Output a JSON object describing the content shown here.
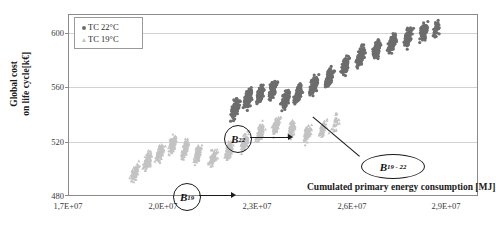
{
  "chart_data": {
    "type": "scatter",
    "title": "",
    "xlabel": "Cumulated primary energy consumption [MJ]",
    "ylabel": "Global cost\non life cycle[k€]",
    "ylabel_line1": "Global cost",
    "ylabel_line2": "on life cycle[k€]",
    "xlim": [
      17000000,
      30000000
    ],
    "ylim": [
      480,
      615
    ],
    "grid": true,
    "legend_position": "top-left",
    "x_ticks": [
      {
        "value": 17000000,
        "label": "1,7E+07"
      },
      {
        "value": 20000000,
        "label": "2,0E+07"
      },
      {
        "value": 23000000,
        "label": "2,3E+07"
      },
      {
        "value": 26000000,
        "label": "2,6E+07"
      },
      {
        "value": 29000000,
        "label": "2,9E+07"
      }
    ],
    "y_ticks": [
      {
        "value": 480,
        "label": "480"
      },
      {
        "value": 520,
        "label": "520"
      },
      {
        "value": 560,
        "label": "560"
      },
      {
        "value": 600,
        "label": "600"
      }
    ],
    "series": [
      {
        "name": "TC 22°C",
        "marker": "circle",
        "color": "#6d6d6d",
        "x_range": [
          22100000,
          28900000
        ],
        "y_range": [
          536,
          608
        ],
        "description": "Dark gray circular markers forming dense vertical streak clusters trending upward from lower-left to upper-right",
        "clusters": [
          {
            "cx": 22300000,
            "cy": 545,
            "n": 120
          },
          {
            "cx": 22700000,
            "cy": 552,
            "n": 130
          },
          {
            "cx": 23100000,
            "cy": 556,
            "n": 125
          },
          {
            "cx": 23500000,
            "cy": 559,
            "n": 120
          },
          {
            "cx": 23900000,
            "cy": 551,
            "n": 110
          },
          {
            "cx": 24300000,
            "cy": 556,
            "n": 115
          },
          {
            "cx": 24800000,
            "cy": 562,
            "n": 105
          },
          {
            "cx": 25300000,
            "cy": 568,
            "n": 100
          },
          {
            "cx": 25800000,
            "cy": 577,
            "n": 110
          },
          {
            "cx": 26300000,
            "cy": 584,
            "n": 115
          },
          {
            "cx": 26800000,
            "cy": 589,
            "n": 120
          },
          {
            "cx": 27300000,
            "cy": 594,
            "n": 115
          },
          {
            "cx": 27800000,
            "cy": 598,
            "n": 100
          },
          {
            "cx": 28300000,
            "cy": 602,
            "n": 80
          },
          {
            "cx": 28700000,
            "cy": 604,
            "n": 40
          }
        ]
      },
      {
        "name": "TC 19°C",
        "marker": "triangle",
        "color": "#c3c3c3",
        "x_range": [
          18900000,
          25600000
        ],
        "y_range": [
          489,
          546
        ],
        "description": "Light gray triangular markers forming dense vertical streak clusters trending upward from lower-left to upper-right",
        "clusters": [
          {
            "cx": 19100000,
            "cy": 497,
            "n": 90
          },
          {
            "cx": 19500000,
            "cy": 505,
            "n": 110
          },
          {
            "cx": 19900000,
            "cy": 512,
            "n": 120
          },
          {
            "cx": 20300000,
            "cy": 518,
            "n": 125
          },
          {
            "cx": 20700000,
            "cy": 514,
            "n": 115
          },
          {
            "cx": 21100000,
            "cy": 511,
            "n": 110
          },
          {
            "cx": 21600000,
            "cy": 508,
            "n": 105
          },
          {
            "cx": 22100000,
            "cy": 513,
            "n": 110
          },
          {
            "cx": 22600000,
            "cy": 520,
            "n": 115
          },
          {
            "cx": 23100000,
            "cy": 527,
            "n": 120
          },
          {
            "cx": 23600000,
            "cy": 532,
            "n": 115
          },
          {
            "cx": 24100000,
            "cy": 529,
            "n": 105
          },
          {
            "cx": 24600000,
            "cy": 526,
            "n": 95
          },
          {
            "cx": 25100000,
            "cy": 530,
            "n": 70
          },
          {
            "cx": 25500000,
            "cy": 534,
            "n": 35
          }
        ]
      }
    ],
    "annotations": [
      {
        "id": "b22",
        "label": "B",
        "sub": "22",
        "shape": "circle",
        "points_to": "TC 22°C cluster"
      },
      {
        "id": "b19",
        "label": "B",
        "sub": "19",
        "shape": "circle",
        "points_to": "TC 19°C cluster"
      },
      {
        "id": "b1922",
        "label": "B",
        "sub": "19 - 22",
        "shape": "ellipse",
        "points_to": "overlap region between series"
      }
    ]
  },
  "legend": {
    "items": [
      {
        "label": "TC 22°C",
        "marker": "circle",
        "color": "#6d6d6d"
      },
      {
        "label": "TC 19°C",
        "marker": "triangle",
        "color": "#c3c3c3"
      }
    ]
  },
  "colors": {
    "series_dark": "#6d6d6d",
    "series_light": "#c3c3c3",
    "grid": "#d2d2d2",
    "frame": "#8a8a8a",
    "text": "#1a1a1a"
  }
}
